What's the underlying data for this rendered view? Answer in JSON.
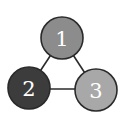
{
  "diagram": {
    "type": "graph",
    "nodes": [
      {
        "id": "1",
        "label": "1",
        "cx": 62,
        "cy": 38,
        "r": 21,
        "fill": "#8c8c8c"
      },
      {
        "id": "2",
        "label": "2",
        "cx": 29,
        "cy": 88,
        "r": 21,
        "fill": "#3c3c3c"
      },
      {
        "id": "3",
        "label": "3",
        "cx": 96,
        "cy": 90,
        "r": 21,
        "fill": "#a8a8a8"
      }
    ],
    "edges": [
      {
        "from": "1",
        "to": "2"
      },
      {
        "from": "1",
        "to": "3"
      },
      {
        "from": "2",
        "to": "3"
      }
    ],
    "stroke": "#2a2a2a"
  }
}
